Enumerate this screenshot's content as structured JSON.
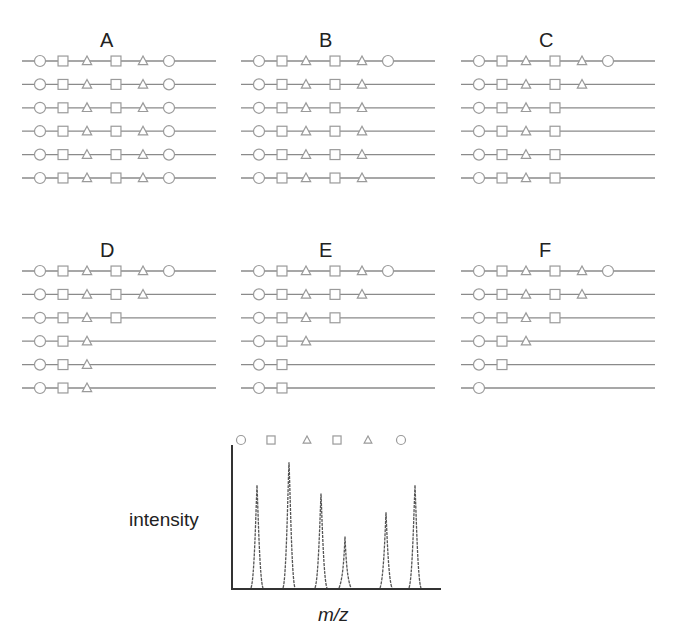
{
  "figure": {
    "panels": [
      {
        "label": "A",
        "rows": [
          [
            "circle",
            "square",
            "triangle",
            "square",
            "triangle",
            "circle"
          ],
          [
            "circle",
            "square",
            "triangle",
            "square",
            "triangle",
            "circle"
          ],
          [
            "circle",
            "square",
            "triangle",
            "square",
            "triangle",
            "circle"
          ],
          [
            "circle",
            "square",
            "triangle",
            "square",
            "triangle",
            "circle"
          ],
          [
            "circle",
            "square",
            "triangle",
            "square",
            "triangle",
            "circle"
          ],
          [
            "circle",
            "square",
            "triangle",
            "square",
            "triangle",
            "circle"
          ]
        ]
      },
      {
        "label": "B",
        "rows": [
          [
            "circle",
            "square",
            "triangle",
            "square",
            "triangle",
            "circle"
          ],
          [
            "circle",
            "square",
            "triangle",
            "square",
            "triangle"
          ],
          [
            "circle",
            "square",
            "triangle",
            "square",
            "triangle"
          ],
          [
            "circle",
            "square",
            "triangle",
            "square",
            "triangle"
          ],
          [
            "circle",
            "square",
            "triangle",
            "square",
            "triangle"
          ],
          [
            "circle",
            "square",
            "triangle",
            "square",
            "triangle"
          ]
        ]
      },
      {
        "label": "C",
        "rows": [
          [
            "circle",
            "square",
            "triangle",
            "square",
            "triangle",
            "circle"
          ],
          [
            "circle",
            "square",
            "triangle",
            "square",
            "triangle"
          ],
          [
            "circle",
            "square",
            "triangle",
            "square"
          ],
          [
            "circle",
            "square",
            "triangle",
            "square"
          ],
          [
            "circle",
            "square",
            "triangle",
            "square"
          ],
          [
            "circle",
            "square",
            "triangle",
            "square"
          ]
        ]
      },
      {
        "label": "D",
        "rows": [
          [
            "circle",
            "square",
            "triangle",
            "square",
            "triangle",
            "circle"
          ],
          [
            "circle",
            "square",
            "triangle",
            "square",
            "triangle"
          ],
          [
            "circle",
            "square",
            "triangle",
            "square"
          ],
          [
            "circle",
            "square",
            "triangle"
          ],
          [
            "circle",
            "square",
            "triangle"
          ],
          [
            "circle",
            "square",
            "triangle"
          ]
        ]
      },
      {
        "label": "E",
        "rows": [
          [
            "circle",
            "square",
            "triangle",
            "square",
            "triangle",
            "circle"
          ],
          [
            "circle",
            "square",
            "triangle",
            "square",
            "triangle"
          ],
          [
            "circle",
            "square",
            "triangle",
            "square"
          ],
          [
            "circle",
            "square",
            "triangle"
          ],
          [
            "circle",
            "square"
          ],
          [
            "circle",
            "square"
          ]
        ]
      },
      {
        "label": "F",
        "rows": [
          [
            "circle",
            "square",
            "triangle",
            "square",
            "triangle",
            "circle"
          ],
          [
            "circle",
            "square",
            "triangle",
            "square",
            "triangle"
          ],
          [
            "circle",
            "square",
            "triangle",
            "square"
          ],
          [
            "circle",
            "square",
            "triangle"
          ],
          [
            "circle",
            "square"
          ],
          [
            "circle"
          ]
        ]
      }
    ],
    "spectrum": {
      "ylabel": "intensity",
      "xlabel": "m/z",
      "peak_symbols": [
        "circle",
        "square",
        "triangle",
        "square",
        "triangle",
        "circle"
      ]
    },
    "colors": {
      "line": "#8a8a8a",
      "marker_stroke": "#9a9a9a",
      "axis": "#333333",
      "peak": "#555555",
      "text": "#222222"
    }
  },
  "chart_data": {
    "type": "line",
    "title": "",
    "xlabel": "m/z",
    "ylabel": "intensity",
    "grid": false,
    "categories": [
      "circle",
      "square",
      "triangle",
      "square",
      "triangle",
      "circle"
    ],
    "peaks": [
      {
        "symbol": "circle",
        "relative_intensity": 0.72
      },
      {
        "symbol": "square",
        "relative_intensity": 0.88
      },
      {
        "symbol": "triangle",
        "relative_intensity": 0.66
      },
      {
        "symbol": "square",
        "relative_intensity": 0.36
      },
      {
        "symbol": "triangle",
        "relative_intensity": 0.53
      },
      {
        "symbol": "circle",
        "relative_intensity": 0.72
      }
    ],
    "values": [
      0.72,
      0.88,
      0.66,
      0.36,
      0.53,
      0.72
    ],
    "ylim": [
      0,
      1
    ]
  }
}
